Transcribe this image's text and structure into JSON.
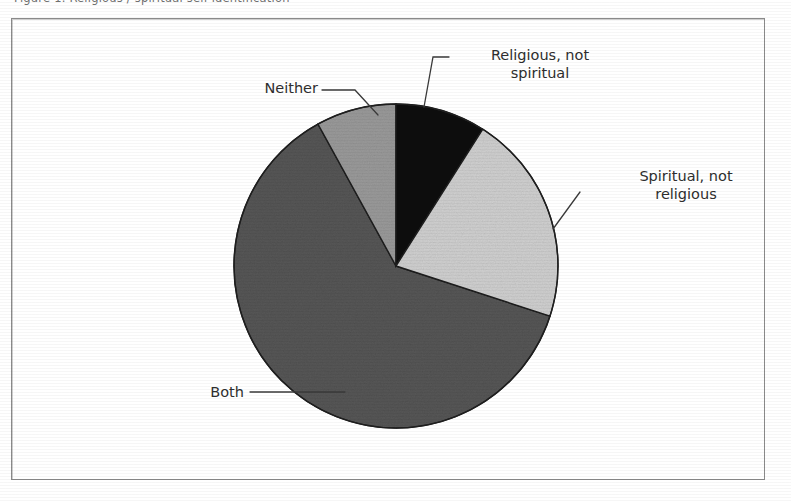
{
  "figure": {
    "caption_clipped": "Figure 1.  Religious / spiritual self-identification",
    "frame_border_color": "#8a8a8a",
    "background_color": "#ffffff"
  },
  "chart_data": {
    "type": "pie",
    "title": "",
    "subtitle": "",
    "xlabel": "",
    "ylabel": "",
    "legend_position": "none",
    "grid": false,
    "labels_placement": "outside-with-leader-lines",
    "start_angle_deg": 0,
    "direction": "clockwise",
    "categories": [
      "Religious, not spiritual",
      "Spiritual, not religious",
      "Both",
      "Neither"
    ],
    "values": [
      9,
      21,
      62,
      8
    ],
    "units": "percent",
    "slices": [
      {
        "label": "Religious, not spiritual",
        "value": 9,
        "color": "#0f0f0f",
        "start_deg": 0,
        "end_deg": 32.4
      },
      {
        "label": "Spiritual, not religious",
        "value": 21,
        "color": "#d0d0d0",
        "start_deg": 32.4,
        "end_deg": 108.0
      },
      {
        "label": "Both",
        "value": 62,
        "color": "#565656",
        "start_deg": 108.0,
        "end_deg": 331.2
      },
      {
        "label": "Neither",
        "value": 8,
        "color": "#9a9a9a",
        "start_deg": 331.2,
        "end_deg": 360.0
      }
    ]
  },
  "labels": {
    "religious": "Religious, not\nspiritual",
    "spiritual": "Spiritual, not\nreligious",
    "both": "Both",
    "neither": "Neither"
  },
  "colors": {
    "slice_religious": "#0f0f0f",
    "slice_spiritual": "#d0d0d0",
    "slice_both": "#565656",
    "slice_neither": "#9a9a9a",
    "slice_outline": "#1f1f1f",
    "leader_line": "#3a3a3a",
    "text": "#2e2e2e",
    "frame": "#8a8a8a"
  },
  "geometry": {
    "center_x": 396,
    "center_y": 266,
    "radius": 162
  }
}
